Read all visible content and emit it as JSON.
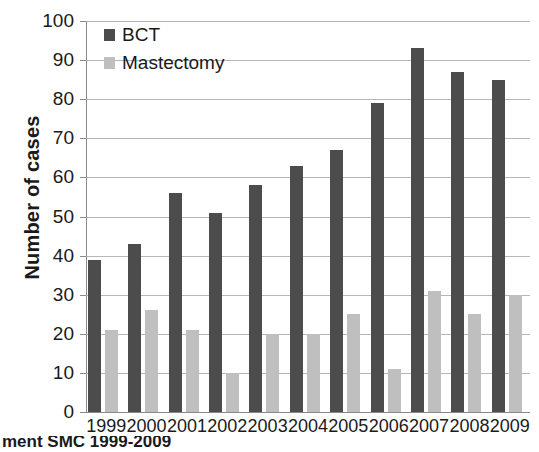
{
  "chart_data": {
    "type": "bar",
    "title": "",
    "xlabel": "",
    "ylabel": "Number of cases",
    "categories": [
      "1999",
      "2000",
      "2001",
      "2002",
      "2003",
      "2004",
      "2005",
      "2006",
      "2007",
      "2008",
      "2009"
    ],
    "series": [
      {
        "name": "BCT",
        "color": "#4c4c4c",
        "values": [
          39,
          43,
          56,
          51,
          58,
          63,
          67,
          79,
          93,
          87,
          85
        ]
      },
      {
        "name": "Mastectomy",
        "color": "#bfbfbf",
        "values": [
          21,
          26,
          21,
          10,
          20,
          20,
          25,
          11,
          31,
          25,
          30
        ]
      }
    ],
    "ylim": [
      0,
      100
    ],
    "ytick_values": [
      0,
      10,
      20,
      30,
      40,
      50,
      60,
      70,
      80,
      90,
      100
    ],
    "ytick_labels": [
      "0",
      "10",
      "20",
      "30",
      "40",
      "50",
      "60",
      "70",
      "80",
      "90",
      "100"
    ],
    "grid": true,
    "legend_position": "top-left"
  },
  "caption": {
    "text": "ment SMC 1999-2009"
  }
}
